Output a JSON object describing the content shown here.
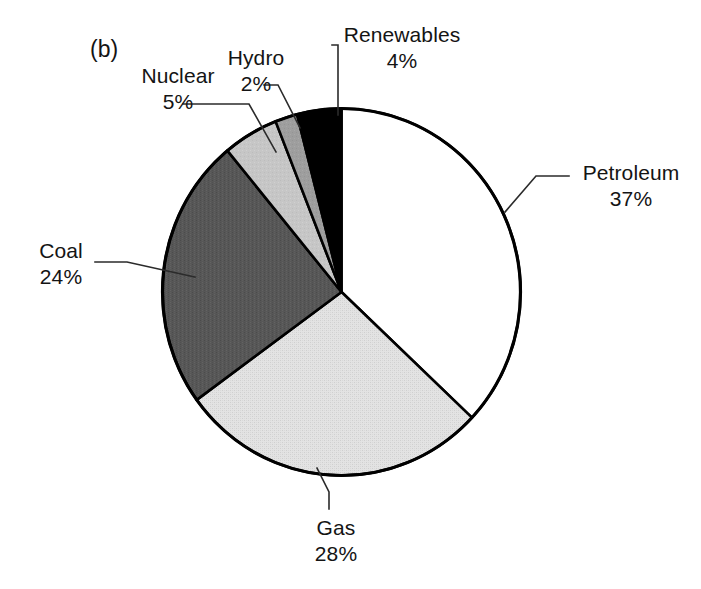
{
  "figure": {
    "panel_tag": "(b)",
    "background_color": "#ffffff",
    "outline_color": "#000000"
  },
  "chart_data": {
    "type": "pie",
    "title": "",
    "subtitle": "",
    "xlabel": "",
    "ylabel": "",
    "legend_position": "none",
    "grid": false,
    "start_angle_deg": 0,
    "direction": "clockwise",
    "units": "percent",
    "total": 100,
    "categories": [
      "Petroleum",
      "Gas",
      "Coal",
      "Nuclear",
      "Hydro",
      "Renewables"
    ],
    "values": [
      37,
      28,
      24,
      5,
      2,
      4
    ],
    "value_labels": [
      "37%",
      "28%",
      "24%",
      "5%",
      "2%",
      "4%"
    ],
    "colors": [
      "#ffffff",
      "#dcdcdc",
      "#575757",
      "#c6c6c6",
      "#9e9e9e",
      "#000000"
    ],
    "slices": [
      {
        "name": "Petroleum",
        "value": 37,
        "value_label": "37%",
        "color": "#ffffff"
      },
      {
        "name": "Gas",
        "value": 28,
        "value_label": "28%",
        "color": "#dcdcdc"
      },
      {
        "name": "Coal",
        "value": 24,
        "value_label": "24%",
        "color": "#575757"
      },
      {
        "name": "Nuclear",
        "value": 5,
        "value_label": "5%",
        "color": "#c6c6c6"
      },
      {
        "name": "Hydro",
        "value": 2,
        "value_label": "2%",
        "color": "#9e9e9e"
      },
      {
        "name": "Renewables",
        "value": 4,
        "value_label": "4%",
        "color": "#000000"
      }
    ]
  },
  "labels": {
    "petroleum": {
      "name": "Petroleum",
      "value": "37%"
    },
    "gas": {
      "name": "Gas",
      "value": "28%"
    },
    "coal": {
      "name": "Coal",
      "value": "24%"
    },
    "nuclear": {
      "name": "Nuclear",
      "value": "5%"
    },
    "hydro": {
      "name": "Hydro",
      "value": "2%"
    },
    "renewables": {
      "name": "Renewables",
      "value": "4%"
    }
  }
}
